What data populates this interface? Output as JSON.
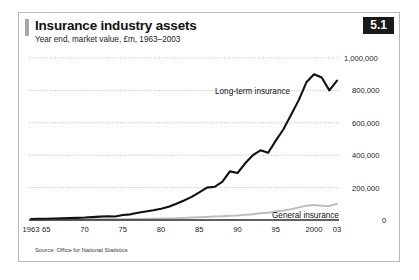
{
  "figure": {
    "number": "5.1",
    "title": "Insurance industry assets",
    "subtitle": "Year end, market value, £m, 1963–2003",
    "source": "Source: Office for National Statistics",
    "accent_color": "#1a1a1a",
    "series_colors": {
      "long_term_insurance": "#111111",
      "general_insurance": "#bdbdbd"
    }
  },
  "chart_data": {
    "type": "line",
    "title": "Insurance industry assets",
    "subtitle": "Year end, market value, £m, 1963–2003",
    "xlabel": "",
    "ylabel": "",
    "ylim": [
      0,
      1000000
    ],
    "xlim": [
      1963,
      2003
    ],
    "grid": true,
    "y_axis_position": "right",
    "yticks": [
      0,
      200000,
      400000,
      600000,
      800000,
      1000000
    ],
    "ytick_labels": [
      "0",
      "200,000",
      "400,000",
      "600,000",
      "800,000",
      "1,000,000"
    ],
    "xticks": [
      1963,
      1965,
      1970,
      1975,
      1980,
      1985,
      1990,
      1995,
      2000,
      2003
    ],
    "xtick_labels": [
      "1963",
      "65",
      "70",
      "75",
      "80",
      "85",
      "90",
      "95",
      "2000",
      "03"
    ],
    "legend_position": "inline-annotations",
    "annotations": [
      {
        "text": "Long-term insurance",
        "series": "Long-term insurance"
      },
      {
        "text": "General insurance",
        "series": "General insurance"
      }
    ],
    "x": [
      1963,
      1964,
      1965,
      1966,
      1967,
      1968,
      1969,
      1970,
      1971,
      1972,
      1973,
      1974,
      1975,
      1976,
      1977,
      1978,
      1979,
      1980,
      1981,
      1982,
      1983,
      1984,
      1985,
      1986,
      1987,
      1988,
      1989,
      1990,
      1991,
      1992,
      1993,
      1994,
      1995,
      1996,
      1997,
      1998,
      1999,
      2000,
      2001,
      2002,
      2003
    ],
    "series": [
      {
        "name": "Long-term insurance",
        "color": "#111111",
        "values": [
          6000,
          7000,
          8000,
          9000,
          10000,
          12000,
          13000,
          15000,
          18000,
          21000,
          23000,
          22000,
          31000,
          35000,
          45000,
          52000,
          60000,
          70000,
          82000,
          100000,
          120000,
          143000,
          170000,
          200000,
          205000,
          235000,
          300000,
          290000,
          350000,
          400000,
          430000,
          415000,
          490000,
          560000,
          650000,
          740000,
          850000,
          900000,
          880000,
          800000,
          860000
        ]
      },
      {
        "name": "General insurance",
        "color": "#bdbdbd",
        "values": [
          2000,
          2200,
          2400,
          2600,
          2800,
          3000,
          3200,
          3500,
          3800,
          4200,
          4500,
          4500,
          5200,
          5800,
          6500,
          7200,
          8000,
          9000,
          10000,
          11500,
          13000,
          15000,
          17000,
          19000,
          21000,
          23000,
          26000,
          28000,
          32000,
          36000,
          42000,
          45000,
          52000,
          58000,
          66000,
          78000,
          88000,
          92000,
          88000,
          86000,
          100000
        ]
      }
    ]
  }
}
